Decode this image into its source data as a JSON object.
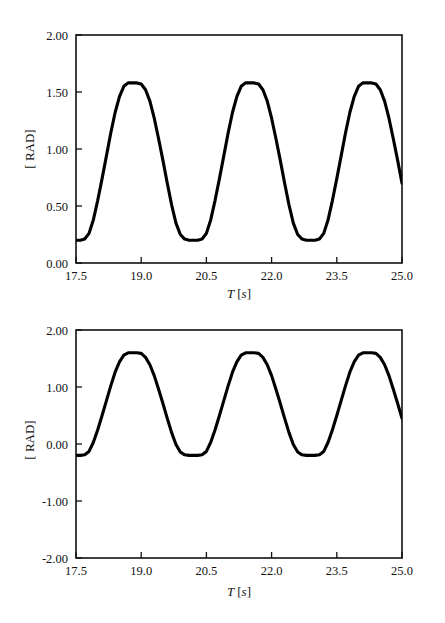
{
  "figure": {
    "background_color": "#ffffff",
    "line_color": "#000000",
    "axis_color": "#111111"
  },
  "panels": [
    {
      "id": "top",
      "ylabel": "[ RAD]",
      "xlabel_main": "T",
      "xlabel_unit": "[s]",
      "y_ticks": [
        "0.00",
        "0.50",
        "1.00",
        "1.50",
        "2.00"
      ],
      "x_ticks": [
        "17.5",
        "19.0",
        "20.5",
        "22.0",
        "23.5",
        "25.0"
      ]
    },
    {
      "id": "bottom",
      "ylabel": "[ RAD]",
      "xlabel_main": "T",
      "xlabel_unit": "[s]",
      "y_ticks": [
        "-2.00",
        "-1.00",
        "0.00",
        "1.00",
        "2.00"
      ],
      "x_ticks": [
        "17.5",
        "19.0",
        "20.5",
        "22.0",
        "23.5",
        "25.0"
      ]
    }
  ],
  "chart_data": [
    {
      "type": "line",
      "panel": "top",
      "title": "",
      "xlabel": "T [s]",
      "ylabel": "[ RAD]",
      "xlim": [
        17.5,
        25.0
      ],
      "ylim": [
        0.0,
        2.0
      ],
      "xticks": [
        17.5,
        19.0,
        20.5,
        22.0,
        23.5,
        25.0
      ],
      "yticks": [
        0.0,
        0.5,
        1.0,
        1.5,
        2.0
      ],
      "grid": false,
      "legend": "none",
      "waveform": "trapezoidal clipped sine",
      "period_s": 1.75,
      "high_level_rad": 1.58,
      "low_level_rad": 0.2,
      "amplitude_rad": 0.69,
      "offset_rad": 0.89,
      "series": [
        {
          "name": "angle",
          "x": [
            17.5,
            17.6,
            17.7,
            17.8,
            17.9,
            18.0,
            18.1,
            18.2,
            18.3,
            18.4,
            18.5,
            18.6,
            18.7,
            18.8,
            18.9,
            19.0,
            19.1,
            19.2,
            19.3,
            19.4,
            19.5,
            19.6,
            19.7,
            19.8,
            19.9,
            20.0,
            20.1,
            20.2,
            20.3,
            20.4,
            20.5,
            20.6,
            20.7,
            20.8,
            20.9,
            21.0,
            21.1,
            21.2,
            21.3,
            21.4,
            21.5,
            21.6,
            21.7,
            21.8,
            21.9,
            22.0,
            22.1,
            22.2,
            22.3,
            22.4,
            22.5,
            22.6,
            22.7,
            22.8,
            22.9,
            23.0,
            23.1,
            23.2,
            23.3,
            23.4,
            23.5,
            23.6,
            23.7,
            23.8,
            23.9,
            24.0,
            24.1,
            24.2,
            24.3,
            24.4,
            24.5,
            24.6,
            24.7,
            24.8,
            24.9,
            25.0
          ],
          "y": [
            0.2,
            0.2,
            0.21,
            0.26,
            0.38,
            0.55,
            0.74,
            0.94,
            1.14,
            1.32,
            1.46,
            1.55,
            1.58,
            1.58,
            1.58,
            1.57,
            1.52,
            1.42,
            1.27,
            1.09,
            0.9,
            0.7,
            0.51,
            0.35,
            0.25,
            0.21,
            0.2,
            0.2,
            0.2,
            0.21,
            0.26,
            0.38,
            0.55,
            0.74,
            0.94,
            1.14,
            1.32,
            1.46,
            1.55,
            1.58,
            1.58,
            1.58,
            1.57,
            1.52,
            1.42,
            1.27,
            1.09,
            0.9,
            0.7,
            0.51,
            0.35,
            0.25,
            0.21,
            0.2,
            0.2,
            0.2,
            0.21,
            0.26,
            0.38,
            0.55,
            0.74,
            0.94,
            1.14,
            1.32,
            1.46,
            1.55,
            1.58,
            1.58,
            1.58,
            1.57,
            1.52,
            1.42,
            1.27,
            1.09,
            0.9,
            0.7
          ]
        }
      ]
    },
    {
      "type": "line",
      "panel": "bottom",
      "title": "",
      "xlabel": "T [s]",
      "ylabel": "[ RAD]",
      "xlim": [
        17.5,
        25.0
      ],
      "ylim": [
        -2.0,
        2.0
      ],
      "xticks": [
        17.5,
        19.0,
        20.5,
        22.0,
        23.5,
        25.0
      ],
      "yticks": [
        -2.0,
        -1.0,
        0.0,
        1.0,
        2.0
      ],
      "grid": false,
      "legend": "none",
      "waveform": "trapezoidal clipped sine",
      "period_s": 1.75,
      "high_level_rad": 1.6,
      "low_level_rad": -0.2,
      "amplitude_rad": 0.9,
      "offset_rad": 0.7,
      "series": [
        {
          "name": "angle",
          "x": [
            17.5,
            17.6,
            17.7,
            17.8,
            17.9,
            18.0,
            18.1,
            18.2,
            18.3,
            18.4,
            18.5,
            18.6,
            18.7,
            18.8,
            18.9,
            19.0,
            19.1,
            19.2,
            19.3,
            19.4,
            19.5,
            19.6,
            19.7,
            19.8,
            19.9,
            20.0,
            20.1,
            20.2,
            20.3,
            20.4,
            20.5,
            20.6,
            20.7,
            20.8,
            20.9,
            21.0,
            21.1,
            21.2,
            21.3,
            21.4,
            21.5,
            21.6,
            21.7,
            21.8,
            21.9,
            22.0,
            22.1,
            22.2,
            22.3,
            22.4,
            22.5,
            22.6,
            22.7,
            22.8,
            22.9,
            23.0,
            23.1,
            23.2,
            23.3,
            23.4,
            23.5,
            23.6,
            23.7,
            23.8,
            23.9,
            24.0,
            24.1,
            24.2,
            24.3,
            24.4,
            24.5,
            24.6,
            24.7,
            24.8,
            24.9,
            25.0
          ],
          "y": [
            -0.2,
            -0.2,
            -0.19,
            -0.13,
            0.03,
            0.25,
            0.5,
            0.76,
            1.02,
            1.26,
            1.44,
            1.56,
            1.6,
            1.6,
            1.6,
            1.59,
            1.52,
            1.39,
            1.2,
            0.96,
            0.71,
            0.45,
            0.2,
            -0.01,
            -0.14,
            -0.19,
            -0.2,
            -0.2,
            -0.2,
            -0.19,
            -0.13,
            0.03,
            0.25,
            0.5,
            0.76,
            1.02,
            1.26,
            1.44,
            1.56,
            1.6,
            1.6,
            1.6,
            1.59,
            1.52,
            1.39,
            1.2,
            0.96,
            0.71,
            0.45,
            0.2,
            -0.01,
            -0.14,
            -0.19,
            -0.2,
            -0.2,
            -0.2,
            -0.19,
            -0.13,
            0.03,
            0.25,
            0.5,
            0.76,
            1.02,
            1.26,
            1.44,
            1.56,
            1.6,
            1.6,
            1.6,
            1.59,
            1.52,
            1.39,
            1.2,
            0.96,
            0.71,
            0.45
          ]
        }
      ]
    }
  ]
}
